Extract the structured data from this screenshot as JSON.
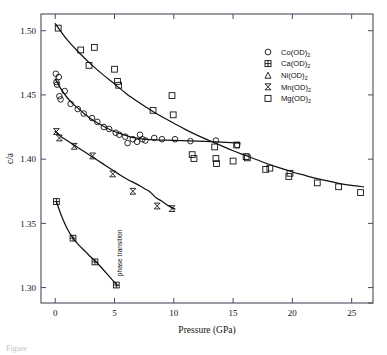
{
  "figure": {
    "caption_fragment": "Figure",
    "annotation": "phase transition"
  },
  "chart_data": {
    "type": "scatter",
    "title": "",
    "xlabel": "Pressure (GPa)",
    "ylabel": "c/a",
    "xlim": [
      -1.2,
      26.8
    ],
    "ylim": [
      1.288,
      1.513
    ],
    "xticks": [
      0,
      5,
      10,
      15,
      20,
      25
    ],
    "xticklabels": [
      "0",
      "5",
      "10",
      "15",
      "20",
      "25"
    ],
    "yticks": [
      1.3,
      1.35,
      1.4,
      1.45,
      1.5
    ],
    "yticklabels": [
      "1.30",
      "1.35",
      "1.40",
      "1.45",
      "1.50"
    ],
    "grid": false,
    "legend_position": "upper-right",
    "annotations": [
      {
        "text": "phase transition",
        "x": 5.6,
        "y": 1.327,
        "rotation": -90
      }
    ],
    "series": [
      {
        "name": "Co(OD)2",
        "label_base": "Co(OD)",
        "label_sub": "2",
        "marker": "circle",
        "points": [
          [
            0.05,
            1.4665
          ],
          [
            0.1,
            1.46
          ],
          [
            0.15,
            1.458
          ],
          [
            0.3,
            1.464
          ],
          [
            0.35,
            1.449
          ],
          [
            0.45,
            1.4465
          ],
          [
            0.8,
            1.453
          ],
          [
            1.3,
            1.443
          ],
          [
            1.9,
            1.439
          ],
          [
            2.4,
            1.4355
          ],
          [
            3.1,
            1.432
          ],
          [
            3.55,
            1.429
          ],
          [
            4.1,
            1.425
          ],
          [
            4.55,
            1.4235
          ],
          [
            5.1,
            1.4205
          ],
          [
            5.4,
            1.419
          ],
          [
            5.9,
            1.4175
          ],
          [
            6.1,
            1.4125
          ],
          [
            6.55,
            1.4155
          ],
          [
            6.9,
            1.4135
          ],
          [
            7.15,
            1.419
          ],
          [
            7.35,
            1.4155
          ],
          [
            7.6,
            1.4145
          ],
          [
            8.35,
            1.4165
          ],
          [
            9.0,
            1.4155
          ],
          [
            10.1,
            1.4155
          ],
          [
            11.4,
            1.414
          ],
          [
            13.55,
            1.4145
          ],
          [
            15.35,
            1.411
          ]
        ]
      },
      {
        "name": "Ca(OD)2",
        "label_base": "Ca(OD)",
        "label_sub": "2",
        "marker": "square-plus",
        "points": [
          [
            0.1,
            1.367
          ],
          [
            1.5,
            1.3385
          ],
          [
            3.35,
            1.32
          ],
          [
            5.15,
            1.302
          ]
        ]
      },
      {
        "name": "Ni(OD)2",
        "label_base": "Ni(OD)",
        "label_sub": "2",
        "marker": "triangle",
        "points": []
      },
      {
        "name": "Mn(OD)2",
        "label_base": "Mn(OD)",
        "label_sub": "2",
        "marker": "bowtie",
        "points": [
          [
            0.1,
            1.4215
          ],
          [
            0.35,
            1.4165
          ],
          [
            1.6,
            1.41
          ],
          [
            3.15,
            1.4025
          ],
          [
            4.85,
            1.3885
          ],
          [
            6.55,
            1.375
          ],
          [
            8.6,
            1.3635
          ],
          [
            9.85,
            1.3615
          ]
        ]
      },
      {
        "name": "Mg(OD)2",
        "label_base": "Mg(OD)",
        "label_sub": "2",
        "marker": "square",
        "points": [
          [
            0.25,
            1.502
          ],
          [
            2.15,
            1.485
          ],
          [
            2.85,
            1.473
          ],
          [
            3.3,
            1.487
          ],
          [
            5.0,
            1.47
          ],
          [
            5.25,
            1.4605
          ],
          [
            5.35,
            1.4575
          ],
          [
            8.25,
            1.438
          ],
          [
            9.85,
            1.4495
          ],
          [
            9.95,
            1.4345
          ],
          [
            11.55,
            1.4035
          ],
          [
            11.7,
            1.4005
          ],
          [
            13.45,
            1.4095
          ],
          [
            13.55,
            1.4005
          ],
          [
            13.6,
            1.3965
          ],
          [
            15.0,
            1.3985
          ],
          [
            15.3,
            1.411
          ],
          [
            16.1,
            1.402
          ],
          [
            16.2,
            1.401
          ],
          [
            17.75,
            1.392
          ],
          [
            18.1,
            1.393
          ],
          [
            19.7,
            1.3865
          ],
          [
            19.8,
            1.389
          ],
          [
            22.1,
            1.3815
          ],
          [
            23.9,
            1.3785
          ],
          [
            25.75,
            1.374
          ]
        ]
      }
    ],
    "fit_curves": [
      {
        "name": "Mg-fit",
        "path": [
          [
            0.0,
            1.5055
          ],
          [
            1.0,
            1.493
          ],
          [
            2.0,
            1.483
          ],
          [
            3.0,
            1.474
          ],
          [
            4.0,
            1.466
          ],
          [
            5.0,
            1.4585
          ],
          [
            6.0,
            1.451
          ],
          [
            7.0,
            1.4445
          ],
          [
            8.0,
            1.4385
          ],
          [
            9.0,
            1.433
          ],
          [
            10.0,
            1.428
          ],
          [
            11.0,
            1.423
          ],
          [
            12.0,
            1.4185
          ],
          [
            13.0,
            1.4145
          ],
          [
            14.0,
            1.4105
          ],
          [
            15.0,
            1.4065
          ],
          [
            16.0,
            1.403
          ],
          [
            17.0,
            1.3995
          ],
          [
            18.0,
            1.396
          ],
          [
            19.0,
            1.393
          ],
          [
            20.0,
            1.39
          ],
          [
            21.0,
            1.3875
          ],
          [
            22.0,
            1.385
          ],
          [
            23.0,
            1.383
          ],
          [
            24.0,
            1.381
          ],
          [
            25.0,
            1.3795
          ],
          [
            26.0,
            1.3785
          ]
        ]
      },
      {
        "name": "Co-Ni-fit",
        "path": [
          [
            0.0,
            1.4625
          ],
          [
            0.5,
            1.4545
          ],
          [
            1.0,
            1.448
          ],
          [
            1.5,
            1.443
          ],
          [
            2.0,
            1.439
          ],
          [
            2.5,
            1.435
          ],
          [
            3.0,
            1.4315
          ],
          [
            3.5,
            1.4285
          ],
          [
            4.0,
            1.426
          ],
          [
            4.5,
            1.4235
          ],
          [
            5.0,
            1.4215
          ],
          [
            5.5,
            1.4198
          ],
          [
            6.0,
            1.4183
          ],
          [
            6.5,
            1.417
          ],
          [
            7.0,
            1.4162
          ],
          [
            7.5,
            1.4156
          ],
          [
            8.5,
            1.415
          ],
          [
            10.0,
            1.4146
          ],
          [
            12.0,
            1.414
          ],
          [
            14.0,
            1.4132
          ],
          [
            15.6,
            1.4125
          ]
        ]
      },
      {
        "name": "Mn-fit",
        "path": [
          [
            0.0,
            1.4215
          ],
          [
            0.5,
            1.4175
          ],
          [
            1.0,
            1.4145
          ],
          [
            1.5,
            1.4115
          ],
          [
            2.0,
            1.4085
          ],
          [
            2.5,
            1.4055
          ],
          [
            3.0,
            1.4025
          ],
          [
            3.5,
            1.3995
          ],
          [
            4.0,
            1.3965
          ],
          [
            4.5,
            1.3935
          ],
          [
            5.0,
            1.3905
          ],
          [
            5.5,
            1.3875
          ],
          [
            6.0,
            1.3848
          ],
          [
            6.5,
            1.3823
          ],
          [
            7.0,
            1.38
          ],
          [
            7.5,
            1.3772
          ],
          [
            8.0,
            1.3745
          ],
          [
            8.5,
            1.37
          ],
          [
            9.0,
            1.3672
          ],
          [
            9.5,
            1.364
          ],
          [
            10.1,
            1.3612
          ]
        ]
      },
      {
        "name": "Ca-fit",
        "path": [
          [
            0.1,
            1.367
          ],
          [
            0.5,
            1.3565
          ],
          [
            1.0,
            1.346
          ],
          [
            1.5,
            1.3385
          ],
          [
            2.0,
            1.333
          ],
          [
            2.5,
            1.3285
          ],
          [
            3.0,
            1.3238
          ],
          [
            3.5,
            1.3195
          ],
          [
            4.0,
            1.3145
          ],
          [
            4.5,
            1.3093
          ],
          [
            5.0,
            1.304
          ],
          [
            5.25,
            1.3015
          ]
        ]
      }
    ]
  }
}
